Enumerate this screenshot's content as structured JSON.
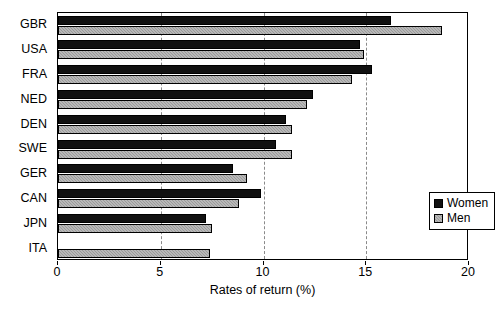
{
  "chart_data": {
    "type": "bar",
    "orientation": "horizontal",
    "title": "",
    "xlabel": "Rates of return (%)",
    "ylabel": "",
    "xlim": [
      0,
      20
    ],
    "xticks": [
      0,
      5,
      10,
      15,
      20
    ],
    "xtick_labels": [
      "0",
      "5",
      "10",
      "15",
      "20"
    ],
    "grid": "vertical-dashed-at-5-10-15",
    "legend_position": "inside-right-middle",
    "categories": [
      "GBR",
      "USA",
      "FRA",
      "NED",
      "DEN",
      "SWE",
      "GER",
      "CAN",
      "JPN",
      "ITA"
    ],
    "series": [
      {
        "name": "Women",
        "color": "#111111",
        "values": [
          16.2,
          14.7,
          15.3,
          12.4,
          11.1,
          10.6,
          8.5,
          9.9,
          7.2,
          0
        ]
      },
      {
        "name": "Men",
        "color": "#9a9a9a",
        "values": [
          18.7,
          14.9,
          14.3,
          12.1,
          11.4,
          11.4,
          9.2,
          8.8,
          7.5,
          7.4
        ]
      }
    ]
  },
  "legend": {
    "entries": [
      {
        "label": "Women",
        "swatch": "black-square"
      },
      {
        "label": "Men",
        "swatch": "gray-square"
      }
    ]
  },
  "axis": {
    "x_title": "Rates of return (%)"
  },
  "caption": {
    "text": ""
  }
}
